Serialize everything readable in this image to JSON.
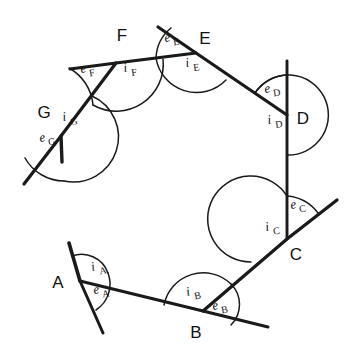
{
  "figure": {
    "stroke_color": "#1a1a1a",
    "background": "#ffffff",
    "vertex_labels": [
      "A",
      "B",
      "C",
      "D",
      "E",
      "F",
      "G"
    ],
    "vertices": [
      {
        "id": "A",
        "label": "A",
        "x": 80,
        "y": 281,
        "label_x": 58,
        "label_y": 288
      },
      {
        "id": "B",
        "label": "B",
        "x": 203,
        "y": 311,
        "label_x": 196,
        "label_y": 336
      },
      {
        "id": "C",
        "label": "C",
        "x": 287,
        "y": 239,
        "label_x": 291,
        "label_y": 259
      },
      {
        "id": "D",
        "label": "D",
        "x": 287,
        "y": 115,
        "label_x": 297,
        "label_y": 123
      },
      {
        "id": "E",
        "label": "E",
        "x": 196,
        "y": 53,
        "label_x": 201,
        "label_y": 43
      },
      {
        "id": "F",
        "label": "F",
        "x": 116,
        "y": 63,
        "label_x": 119,
        "label_y": 39
      },
      {
        "id": "G",
        "label": "G",
        "x": 61,
        "y": 136,
        "label_x": 42,
        "label_y": 116
      }
    ],
    "interior_angles": [
      {
        "id": "iA",
        "base": "i",
        "sub": "A",
        "x": 92,
        "y": 271
      },
      {
        "id": "iB",
        "base": "i",
        "sub": "B",
        "x": 187,
        "y": 296
      },
      {
        "id": "iC",
        "base": "i",
        "sub": "C",
        "x": 266,
        "y": 231
      },
      {
        "id": "iD",
        "base": "i",
        "sub": "D",
        "x": 268,
        "y": 124
      },
      {
        "id": "iE",
        "base": "i",
        "sub": "E",
        "x": 186,
        "y": 67
      },
      {
        "id": "iF",
        "base": "i",
        "sub": "F",
        "x": 124,
        "y": 72
      },
      {
        "id": "iG",
        "base": "i",
        "sub": "G",
        "x": 63,
        "y": 121
      }
    ],
    "exterior_angles": [
      {
        "id": "eA",
        "base": "e",
        "sub": "A",
        "x": 94,
        "y": 294
      },
      {
        "id": "eB",
        "base": "e",
        "sub": "B",
        "x": 213,
        "y": 310
      },
      {
        "id": "eC",
        "base": "e",
        "sub": "C",
        "x": 293,
        "y": 209
      },
      {
        "id": "eD",
        "base": "e",
        "sub": "D",
        "x": 267,
        "y": 93
      },
      {
        "id": "eE",
        "base": "e",
        "sub": "E",
        "x": 166,
        "y": 42
      },
      {
        "id": "eF",
        "base": "e",
        "sub": "F",
        "x": 82,
        "y": 73
      },
      {
        "id": "eG",
        "base": "e",
        "sub": "G",
        "x": 43,
        "y": 141
      }
    ],
    "sides": [
      {
        "from": "A",
        "to": "B"
      },
      {
        "from": "B",
        "to": "C"
      },
      {
        "from": "C",
        "to": "D"
      },
      {
        "from": "D",
        "to": "E"
      },
      {
        "from": "E",
        "to": "F"
      },
      {
        "from": "F",
        "to": "G"
      },
      {
        "from": "G",
        "to": "A"
      }
    ]
  }
}
